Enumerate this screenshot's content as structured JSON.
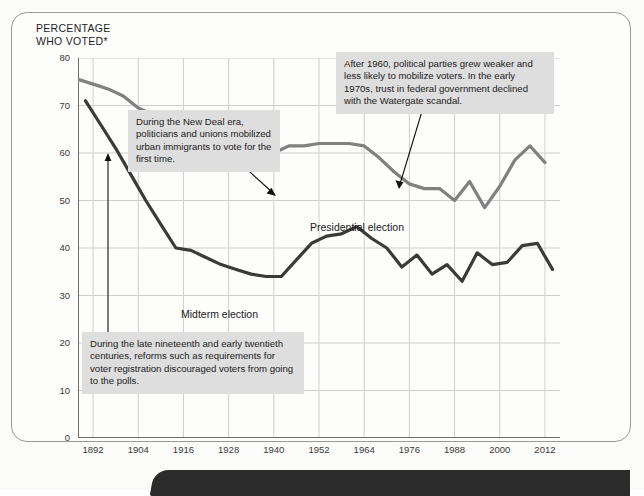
{
  "figure": {
    "axis_title": "PERCENTAGE\nWHO VOTED*"
  },
  "annotations": [
    {
      "id": "new-deal",
      "text": "During the New Deal era, politicians and unions mobilized urban immigrants to vote for the first time."
    },
    {
      "id": "after-1960",
      "text": "After 1960, political parties grew weaker and less likely to mobilize voters. In the early 1970s, trust in federal government declined with the Watergate scandal."
    },
    {
      "id": "late-nineteenth",
      "text": "During the late nineteenth and early twentieth centuries, reforms such as requirements for voter registration discouraged voters from going to the polls."
    }
  ],
  "series_labels": {
    "presidential": "Presidential election",
    "midterm": "Midterm election"
  },
  "colors": {
    "presidential_line": "#808080",
    "midterm_line": "#3a3a3a",
    "grid": "#cfcfcf",
    "axis": "#6e6e6e",
    "note_background": "#dedede",
    "page_edge": "#2b2b2b"
  },
  "chart_data": {
    "type": "line",
    "title": "",
    "xlabel": "",
    "ylabel": "PERCENTAGE WHO VOTED*",
    "xlim": [
      1888,
      2016
    ],
    "ylim": [
      0,
      80
    ],
    "grid": true,
    "legend": "inline-labels",
    "xticks": [
      1892,
      1904,
      1916,
      1928,
      1940,
      1952,
      1964,
      1976,
      1988,
      2000,
      2012
    ],
    "yticks": [
      0,
      10,
      20,
      30,
      40,
      50,
      60,
      70,
      80
    ],
    "series": [
      {
        "name": "Presidential election",
        "color": "#808080",
        "x": [
          1888,
          1892,
          1896,
          1900,
          1904,
          1908,
          1912,
          1916,
          1920,
          1924,
          1928,
          1932,
          1936,
          1940,
          1944,
          1948,
          1952,
          1956,
          1960,
          1964,
          1968,
          1972,
          1976,
          1980,
          1984,
          1988,
          1992,
          1996,
          2000,
          2004,
          2008,
          2012
        ],
        "values": [
          75.5,
          74.5,
          73.5,
          72.0,
          69.5,
          68.0,
          65.0,
          63.0,
          61.5,
          60.0,
          58.5,
          56.5,
          58.5,
          60.0,
          61.5,
          61.5,
          62.0,
          62.0,
          62.0,
          61.5,
          59.0,
          56.0,
          53.5,
          52.5,
          52.5,
          50.0,
          54.0,
          48.5,
          53.0,
          58.5,
          61.5,
          58.0
        ]
      },
      {
        "name": "Midterm election",
        "color": "#3a3a3a",
        "x": [
          1890,
          1894,
          1898,
          1902,
          1906,
          1910,
          1914,
          1918,
          1922,
          1926,
          1930,
          1934,
          1938,
          1942,
          1946,
          1950,
          1954,
          1958,
          1962,
          1966,
          1970,
          1974,
          1978,
          1982,
          1986,
          1990,
          1994,
          1998,
          2002,
          2006,
          2010,
          2014
        ],
        "values": [
          71.0,
          66.0,
          61.0,
          55.5,
          50.0,
          45.0,
          40.0,
          39.5,
          38.0,
          36.5,
          35.5,
          34.5,
          34.0,
          34.0,
          37.5,
          41.0,
          42.5,
          43.0,
          44.5,
          42.0,
          40.0,
          36.0,
          38.5,
          34.5,
          36.5,
          33.0,
          39.0,
          36.5,
          37.0,
          40.5,
          41.0,
          35.5
        ]
      }
    ]
  }
}
